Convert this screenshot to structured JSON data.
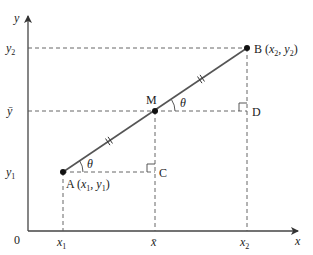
{
  "diagram": {
    "axes": {
      "x_label": "x",
      "y_label": "y",
      "origin_label": "0"
    },
    "x_ticks": [
      {
        "label_main": "x",
        "label_sub": "1"
      },
      {
        "label_main": "x̄",
        "label_sub": ""
      },
      {
        "label_main": "x",
        "label_sub": "2"
      }
    ],
    "y_ticks": [
      {
        "label_main": "y",
        "label_sub": "1"
      },
      {
        "label_main": "ȳ",
        "label_sub": ""
      },
      {
        "label_main": "y",
        "label_sub": "2"
      }
    ],
    "points": {
      "A": {
        "name": "A",
        "coords_open": " (",
        "x": "x",
        "x_sub": "1",
        "sep": ", ",
        "y": "y",
        "y_sub": "1",
        "coords_close": ")"
      },
      "M": {
        "name": "M"
      },
      "B": {
        "name": "B",
        "coords_open": " (",
        "x": "x",
        "x_sub": "2",
        "sep": ", ",
        "y": "y",
        "y_sub": "2",
        "coords_close": ")"
      },
      "C": {
        "name": "C"
      },
      "D": {
        "name": "D"
      }
    },
    "angle_label": "θ",
    "equal_segment_marks": 2
  }
}
